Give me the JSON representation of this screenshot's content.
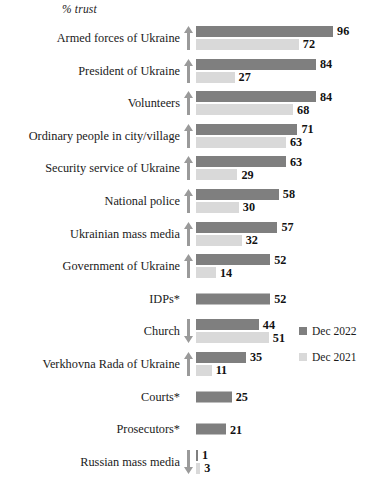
{
  "chart_data": {
    "type": "bar",
    "orientation": "horizontal",
    "title": "",
    "axis_title": "% trust",
    "xlabel": "% trust",
    "ylabel": "",
    "xlim": [
      0,
      100
    ],
    "grid": false,
    "legend_position": "right-bottom",
    "categories": [
      "Armed forces of Ukraine",
      "President of Ukraine",
      "Volunteers",
      "Ordinary people in city/village",
      "Security service of Ukraine",
      "National police",
      "Ukrainian mass media",
      "Government of Ukraine",
      "IDPs*",
      "Church",
      "Verkhovna Rada of Ukraine",
      "Courts*",
      "Prosecutors*",
      "Russian mass media"
    ],
    "series": [
      {
        "name": "Dec 2022",
        "color": "#7f7f7f",
        "values": [
          96,
          84,
          84,
          71,
          63,
          58,
          57,
          52,
          52,
          44,
          35,
          25,
          21,
          1
        ]
      },
      {
        "name": "Dec 2021",
        "color": "#d9d9d9",
        "values": [
          72,
          27,
          68,
          63,
          29,
          30,
          32,
          14,
          null,
          51,
          11,
          null,
          null,
          3
        ]
      }
    ],
    "trend_arrows": [
      "up",
      "up",
      "up",
      "up",
      "up",
      "up",
      "up",
      "up",
      "none",
      "down",
      "up",
      "none",
      "none",
      "down"
    ]
  },
  "rows": [
    {
      "label": "Armed forces of Ukraine",
      "cur": 96,
      "prev": 72,
      "arrow": "up"
    },
    {
      "label": "President of Ukraine",
      "cur": 84,
      "prev": 27,
      "arrow": "up"
    },
    {
      "label": "Volunteers",
      "cur": 84,
      "prev": 68,
      "arrow": "up"
    },
    {
      "label": "Ordinary people in city/village",
      "cur": 71,
      "prev": 63,
      "arrow": "up"
    },
    {
      "label": "Security service of Ukraine",
      "cur": 63,
      "prev": 29,
      "arrow": "up"
    },
    {
      "label": "National police",
      "cur": 58,
      "prev": 30,
      "arrow": "up"
    },
    {
      "label": "Ukrainian mass media",
      "cur": 57,
      "prev": 32,
      "arrow": "up"
    },
    {
      "label": "Government of Ukraine",
      "cur": 52,
      "prev": 14,
      "arrow": "up"
    },
    {
      "label": "IDPs*",
      "cur": 52,
      "prev": null,
      "arrow": "none"
    },
    {
      "label": "Church",
      "cur": 44,
      "prev": 51,
      "arrow": "down"
    },
    {
      "label": "Verkhovna Rada of Ukraine",
      "cur": 35,
      "prev": 11,
      "arrow": "up"
    },
    {
      "label": "Courts*",
      "cur": 25,
      "prev": null,
      "arrow": "none"
    },
    {
      "label": "Prosecutors*",
      "cur": 21,
      "prev": null,
      "arrow": "none"
    },
    {
      "label": "Russian mass media",
      "cur": 1,
      "prev": 3,
      "arrow": "down"
    }
  ],
  "legend": {
    "current_label": "Dec 2022",
    "previous_label": "Dec 2021",
    "current_color": "#7f7f7f",
    "previous_color": "#d9d9d9"
  },
  "scale": {
    "px_per_unit": 1.428,
    "bar_origin_x": 196
  }
}
